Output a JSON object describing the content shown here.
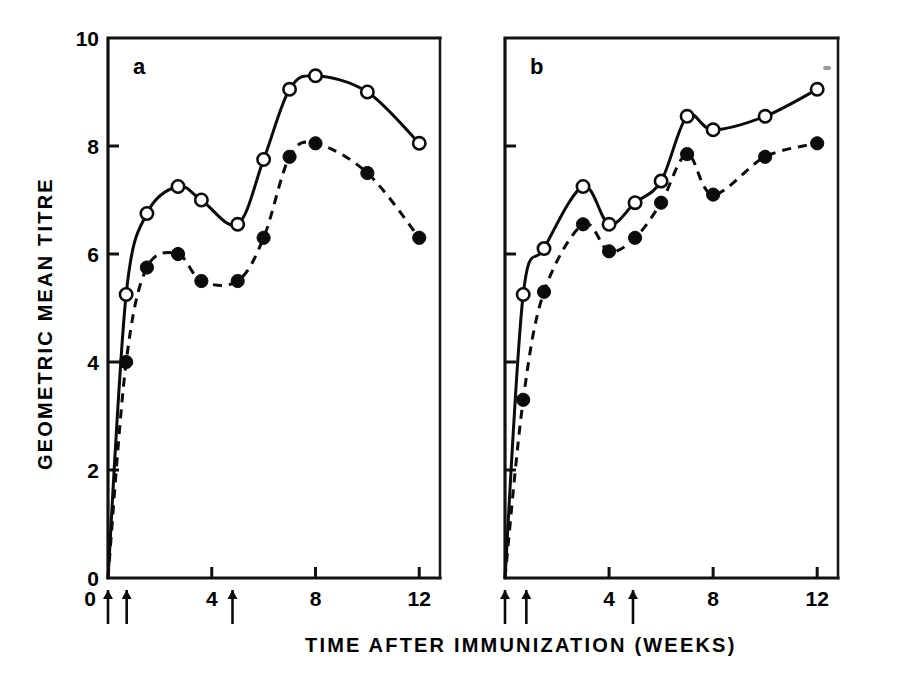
{
  "figure": {
    "background_color": "#ffffff",
    "ink_color": "#000000",
    "xlabel": "TIME  AFTER  IMMUNIZATION  (WEEKS)",
    "ylabel": "GEOMETRIC  MEAN  TITRE"
  },
  "chart_data": [
    {
      "type": "line",
      "panel_label": "a",
      "title": "",
      "xlabel": "TIME  AFTER  IMMUNIZATION  (WEEKS)",
      "ylabel": "GEOMETRIC  MEAN  TITRE",
      "xlim": [
        0,
        12.8
      ],
      "ylim": [
        0,
        10
      ],
      "xticks": [
        0,
        4,
        8,
        12
      ],
      "xtick_labels": [
        "0",
        "4",
        "8",
        "12"
      ],
      "yticks": [
        0,
        2,
        4,
        6,
        8,
        10
      ],
      "ytick_labels": [
        "0",
        "2",
        "4",
        "6",
        "8",
        "10"
      ],
      "grid": false,
      "legend_position": "none",
      "immunization_arrows_weeks": [
        0,
        0.72,
        4.8
      ],
      "series": [
        {
          "name": "open-circle series",
          "marker": "open-circle",
          "linestyle": "solid",
          "x": [
            0,
            0.7,
            1.5,
            2.7,
            3.6,
            5.0,
            6.0,
            7.0,
            8.0,
            10.0,
            12.0
          ],
          "y": [
            0.0,
            5.25,
            6.75,
            7.25,
            7.0,
            6.55,
            7.75,
            9.05,
            9.3,
            9.0,
            8.05
          ]
        },
        {
          "name": "filled-circle series",
          "marker": "filled-circle",
          "linestyle": "dashed",
          "x": [
            0,
            0.7,
            1.5,
            2.7,
            3.6,
            5.0,
            6.0,
            7.0,
            8.0,
            10.0,
            12.0
          ],
          "y": [
            0.0,
            4.0,
            5.75,
            6.0,
            5.5,
            5.5,
            6.3,
            7.8,
            8.05,
            7.5,
            6.3
          ]
        }
      ]
    },
    {
      "type": "line",
      "panel_label": "b",
      "title": "",
      "xlabel": "TIME  AFTER  IMMUNIZATION  (WEEKS)",
      "ylabel": "GEOMETRIC  MEAN  TITRE",
      "xlim": [
        0,
        12.8
      ],
      "ylim": [
        0,
        10
      ],
      "xticks": [
        0,
        4,
        8,
        12
      ],
      "xtick_labels": [
        "0",
        "4",
        "8",
        "12"
      ],
      "yticks": [
        0,
        2,
        4,
        6,
        8,
        10
      ],
      "ytick_labels": [
        "",
        "",
        "",
        "",
        "",
        ""
      ],
      "grid": false,
      "legend_position": "none",
      "immunization_arrows_weeks": [
        0,
        0.82,
        4.92
      ],
      "series": [
        {
          "name": "open-circle series",
          "marker": "open-circle",
          "linestyle": "solid",
          "x": [
            0,
            0.7,
            1.5,
            3.0,
            4.0,
            5.0,
            6.0,
            7.0,
            8.0,
            10.0,
            12.0
          ],
          "y": [
            0.0,
            5.25,
            6.1,
            7.25,
            6.55,
            6.95,
            7.35,
            8.55,
            8.3,
            8.55,
            9.05
          ]
        },
        {
          "name": "filled-circle series",
          "marker": "filled-circle",
          "linestyle": "dashed",
          "x": [
            0,
            0.7,
            1.5,
            3.0,
            4.0,
            5.0,
            6.0,
            7.0,
            8.0,
            10.0,
            12.0
          ],
          "y": [
            0.0,
            3.3,
            5.3,
            6.55,
            6.05,
            6.3,
            6.95,
            7.85,
            7.1,
            7.8,
            8.05
          ]
        }
      ]
    }
  ]
}
